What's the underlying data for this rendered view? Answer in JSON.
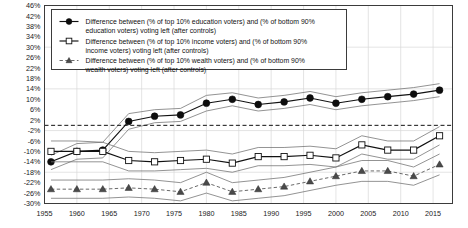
{
  "chart_data": {
    "type": "line",
    "title": "",
    "xlabel": "",
    "ylabel": "",
    "xlim": [
      1955,
      2018
    ],
    "ylim": [
      -30,
      46
    ],
    "ytick_step": 4,
    "grid": true,
    "legend_position": "top-left-inside",
    "zero_reference_line": true,
    "ytick_labels": [
      "46%",
      "42%",
      "38%",
      "34%",
      "30%",
      "26%",
      "22%",
      "18%",
      "14%",
      "10%",
      "6%",
      "2%",
      "-2%",
      "-6%",
      "-10%",
      "-14%",
      "-18%",
      "-22%",
      "-26%",
      "-30%"
    ],
    "ytick_values": [
      46,
      42,
      38,
      34,
      30,
      26,
      22,
      18,
      14,
      10,
      6,
      2,
      -2,
      -6,
      -10,
      -14,
      -18,
      -22,
      -26,
      -30
    ],
    "xtick_labels": [
      "1955",
      "1960",
      "1965",
      "1970",
      "1975",
      "1980",
      "1985",
      "1990",
      "1995",
      "2000",
      "2005",
      "2010",
      "2015"
    ],
    "xtick_values": [
      1955,
      1960,
      1965,
      1970,
      1975,
      1980,
      1985,
      1990,
      1995,
      2000,
      2005,
      2010,
      2015
    ],
    "x": [
      1956,
      1960,
      1964,
      1968,
      1972,
      1976,
      1980,
      1984,
      1988,
      1992,
      1996,
      2000,
      2004,
      2008,
      2012,
      2016
    ],
    "series": [
      {
        "name": "education",
        "marker": "filled-circle",
        "color": "#0d0d0d",
        "legend": "Difference between (% of top 10% education voters) and (% of bottom 90% education voters) voting left (after controls)",
        "values": [
          -14.0,
          -10.0,
          -9.5,
          1.5,
          3.5,
          4.0,
          8.5,
          10.0,
          8.0,
          9.0,
          10.5,
          8.5,
          10.0,
          11.0,
          12.0,
          13.5
        ],
        "ci_upper": [
          -11.5,
          -7.0,
          -6.5,
          4.5,
          6.0,
          6.5,
          11.5,
          12.5,
          10.5,
          11.5,
          13.0,
          11.0,
          12.5,
          13.5,
          14.5,
          16.0
        ],
        "ci_lower": [
          -17.0,
          -13.0,
          -12.5,
          -1.5,
          1.0,
          1.5,
          5.5,
          7.5,
          5.5,
          6.5,
          8.0,
          6.0,
          7.5,
          8.5,
          9.5,
          11.0
        ]
      },
      {
        "name": "income",
        "marker": "open-square",
        "color": "#111111",
        "legend": "Difference between (% of top 10% income voters) and (% of bottom 90% income voters) voting left (after controls)",
        "values": [
          -10.0,
          -10.0,
          -10.0,
          -13.5,
          -14.0,
          -13.5,
          -13.0,
          -14.5,
          -12.0,
          -12.0,
          -11.5,
          -12.5,
          -7.5,
          -9.5,
          -9.5,
          -4.0
        ],
        "ci_upper": [
          -6.0,
          -6.0,
          -6.5,
          -10.0,
          -10.5,
          -10.0,
          -9.5,
          -11.0,
          -8.5,
          -8.5,
          -8.0,
          -9.0,
          -4.0,
          -6.0,
          -6.0,
          -0.5
        ],
        "ci_lower": [
          -14.0,
          -14.0,
          -14.0,
          -17.5,
          -17.5,
          -17.0,
          -16.5,
          -18.0,
          -15.5,
          -15.5,
          -15.0,
          -16.0,
          -11.0,
          -13.0,
          -13.0,
          -7.5
        ]
      },
      {
        "name": "wealth",
        "marker": "filled-triangle",
        "color": "#4a4a4a",
        "legend": "Difference between (% of top 10% wealth voters) and (% of bottom 90% wealth voters) voting left (after controls)",
        "values": [
          -24.5,
          -24.5,
          -24.5,
          -24.0,
          -24.5,
          -25.5,
          -22.0,
          -25.5,
          -24.5,
          -23.5,
          -21.5,
          -19.5,
          -17.5,
          -17.5,
          -19.5,
          -15.0
        ],
        "ci_upper": [
          -21.0,
          -21.0,
          -21.0,
          -20.5,
          -21.0,
          -22.0,
          -18.0,
          -22.0,
          -21.0,
          -20.0,
          -18.0,
          -16.0,
          -13.5,
          -13.5,
          -16.0,
          -11.0
        ],
        "ci_lower": [
          -28.0,
          -28.0,
          -28.0,
          -27.5,
          -28.0,
          -29.0,
          -26.0,
          -29.0,
          -28.0,
          -27.0,
          -25.0,
          -23.0,
          -21.5,
          -21.5,
          -23.0,
          -19.0
        ]
      }
    ],
    "legend_lines": [
      [
        "Difference between (% of top 10% education voters) and (% of bottom 90%",
        "education voters) voting left (after controls)"
      ],
      [
        "Difference between (% of top 10% income voters) and (% of bottom 90%",
        "income voters) voting left (after controls)"
      ],
      [
        "Difference between (% of top 10% wealth voters) and (% of bottom 90%",
        "wealth voters) voting left (after controls)"
      ]
    ]
  }
}
